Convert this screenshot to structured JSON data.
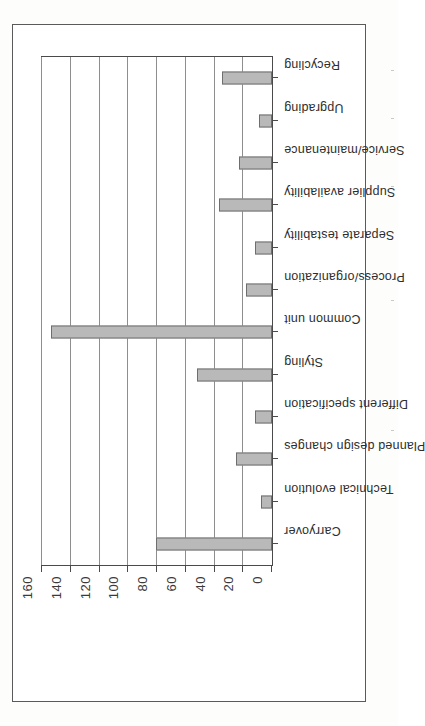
{
  "chart_data": {
    "type": "bar",
    "title": "",
    "subtitle": "",
    "xlabel": "",
    "ylabel": "",
    "ylim": [
      0,
      160
    ],
    "grid": true,
    "legend": false,
    "orientation": "vertical-bars-on-rotated-page",
    "ytick_labels": [
      "0",
      "20",
      "40",
      "60",
      "80",
      "100",
      "120",
      "140",
      "160"
    ],
    "yticks": [
      0,
      20,
      40,
      60,
      80,
      100,
      120,
      140,
      160
    ],
    "categories": [
      "Carryover",
      "Technical evolution",
      "Planned design changes",
      "Different specification",
      "Styling",
      "Common unit",
      "Process/organization",
      "Separate testability",
      "Supplier availability",
      "Service/maintenance",
      "Upgrading",
      "Recycling"
    ],
    "values": [
      81,
      8,
      25,
      12,
      52,
      154,
      18,
      12,
      37,
      23,
      9,
      35
    ],
    "bar_color": "#b9b9b9",
    "bar_border_color": "#6e6e6e",
    "gridline_color": "#8e8e8e",
    "axis_color": "#4a4a4a"
  },
  "figure": {
    "frame_color": "#5a5a5a",
    "page_background": "#fdfdfc"
  }
}
